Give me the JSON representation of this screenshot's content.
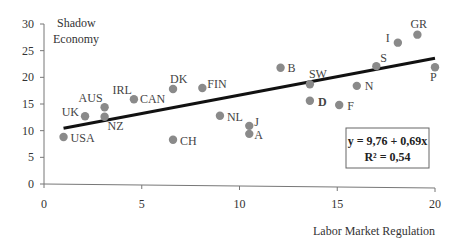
{
  "chart_data": {
    "type": "scatter",
    "title": "",
    "xlabel": "Labor Market Regulation",
    "ylabel": "Shadow Economy",
    "ylabel_lines": [
      "Shadow",
      "Economy"
    ],
    "xlim": [
      0,
      20
    ],
    "ylim": [
      0,
      30
    ],
    "xticks": [
      0,
      5,
      10,
      15,
      20
    ],
    "yticks": [
      0,
      5,
      10,
      15,
      20,
      25,
      30
    ],
    "grid": false,
    "legend": null,
    "point_color": "#8a8a8a",
    "points": [
      {
        "label": "USA",
        "x": 1.0,
        "y": 8.8
      },
      {
        "label": "UK",
        "x": 2.1,
        "y": 12.7
      },
      {
        "label": "AUS",
        "x": 3.1,
        "y": 14.4
      },
      {
        "label": "NZ",
        "x": 3.1,
        "y": 12.6
      },
      {
        "label": "IRL",
        "x": 4.6,
        "y": 15.9
      },
      {
        "label": "CAN",
        "x": 4.6,
        "y": 15.9
      },
      {
        "label": "DK",
        "x": 6.6,
        "y": 17.8
      },
      {
        "label": "CH",
        "x": 6.6,
        "y": 8.3
      },
      {
        "label": "FIN",
        "x": 8.1,
        "y": 18.0
      },
      {
        "label": "NL",
        "x": 9.0,
        "y": 12.8
      },
      {
        "label": "J",
        "x": 10.5,
        "y": 10.9
      },
      {
        "label": "A",
        "x": 10.5,
        "y": 9.4
      },
      {
        "label": "B",
        "x": 12.1,
        "y": 21.8
      },
      {
        "label": "SW",
        "x": 13.6,
        "y": 18.7
      },
      {
        "label": "D",
        "x": 13.6,
        "y": 15.6
      },
      {
        "label": "F",
        "x": 15.1,
        "y": 14.8
      },
      {
        "label": "N",
        "x": 16.0,
        "y": 18.4
      },
      {
        "label": "S",
        "x": 17.0,
        "y": 22.1
      },
      {
        "label": "I",
        "x": 18.1,
        "y": 26.5
      },
      {
        "label": "GR",
        "x": 19.1,
        "y": 28.0
      },
      {
        "label": "P",
        "x": 20.0,
        "y": 21.9
      }
    ],
    "regression": {
      "intercept": 9.76,
      "slope": 0.69,
      "x_range": [
        1,
        20
      ],
      "color": "#111111",
      "equation_label": "y = 9,76 + 0,69x",
      "r2_label": "R² = 0,54"
    },
    "annotations": [
      {
        "text": "y = 9,76 + 0,69x",
        "position": "lower-right box"
      },
      {
        "text": "R² = 0,54",
        "position": "lower-right box"
      }
    ]
  }
}
